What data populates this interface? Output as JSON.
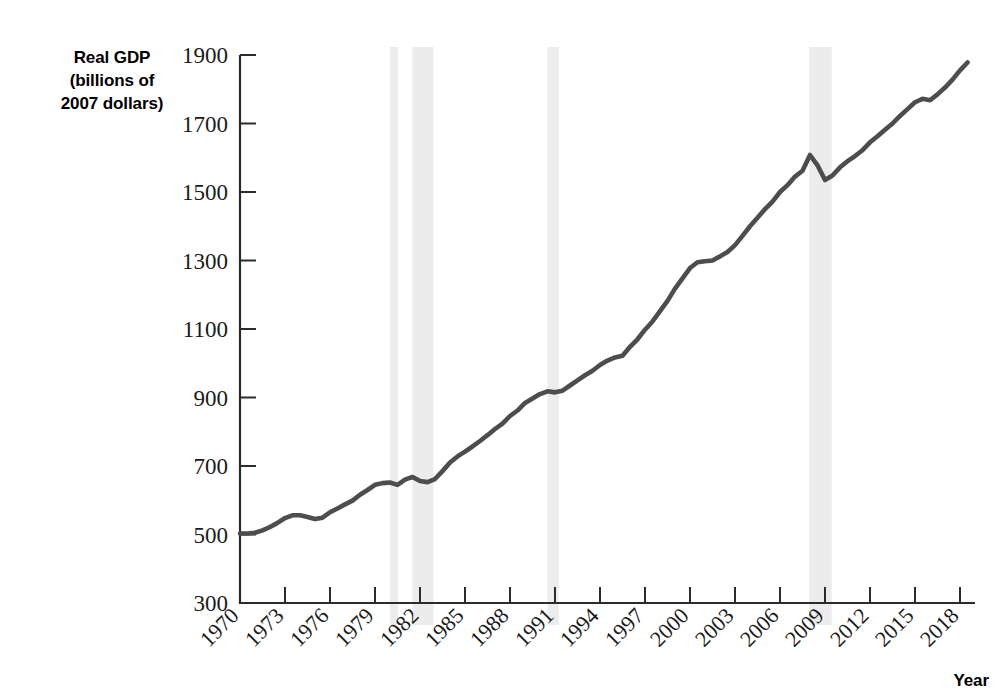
{
  "chart_data": {
    "type": "line",
    "title": "",
    "ylabel": "Real GDP (billions of 2007 dollars)",
    "ylabel_lines": [
      "Real GDP",
      "(billions of",
      "2007 dollars)"
    ],
    "xlabel": "Year",
    "xlim": [
      1970,
      2019
    ],
    "ylim": [
      300,
      1900
    ],
    "ytick_labels": [
      "1900",
      "1700",
      "1500",
      "1300",
      "1100",
      "900",
      "700",
      "500",
      "300"
    ],
    "ytick_values": [
      1900,
      1700,
      1500,
      1300,
      1100,
      900,
      700,
      500,
      300
    ],
    "xtick_labels": [
      "1970",
      "1973",
      "1976",
      "1979",
      "1982",
      "1985",
      "1988",
      "1991",
      "1994",
      "1997",
      "2000",
      "2003",
      "2006",
      "2009",
      "2012",
      "2015",
      "2018"
    ],
    "xtick_values": [
      1970,
      1973,
      1976,
      1979,
      1982,
      1985,
      1988,
      1991,
      1994,
      1997,
      2000,
      2003,
      2006,
      2009,
      2012,
      2015,
      2018
    ],
    "grid": false,
    "legend": null,
    "line_color": "#4d4d4d",
    "recession_band_color": "#ececec",
    "recession_bands": [
      {
        "start": 1980.0,
        "end": 1980.55,
        "label": "1980 recession"
      },
      {
        "start": 1981.5,
        "end": 1982.9,
        "label": "1981-82 recession"
      },
      {
        "start": 1990.5,
        "end": 1991.25,
        "label": "1990-91 recession"
      },
      {
        "start": 2007.95,
        "end": 2009.45,
        "label": "2007-09 recession"
      }
    ],
    "series": [
      {
        "name": "Real GDP",
        "x": [
          1970.0,
          1970.5,
          1971.0,
          1971.5,
          1972.0,
          1972.5,
          1973.0,
          1973.5,
          1974.0,
          1974.5,
          1975.0,
          1975.5,
          1976.0,
          1976.5,
          1977.0,
          1977.5,
          1978.0,
          1978.5,
          1979.0,
          1979.5,
          1980.0,
          1980.5,
          1981.0,
          1981.5,
          1982.0,
          1982.5,
          1983.0,
          1983.5,
          1984.0,
          1984.5,
          1985.0,
          1985.5,
          1986.0,
          1986.5,
          1987.0,
          1987.5,
          1988.0,
          1988.5,
          1989.0,
          1989.5,
          1990.0,
          1990.5,
          1991.0,
          1991.5,
          1992.0,
          1992.5,
          1993.0,
          1993.5,
          1994.0,
          1994.5,
          1995.0,
          1995.5,
          1996.0,
          1996.5,
          1997.0,
          1997.5,
          1998.0,
          1998.5,
          1999.0,
          1999.5,
          2000.0,
          2000.5,
          2001.0,
          2001.5,
          2002.0,
          2002.5,
          2003.0,
          2003.5,
          2004.0,
          2004.5,
          2005.0,
          2005.5,
          2006.0,
          2006.5,
          2007.0,
          2007.5,
          2008.0,
          2008.5,
          2009.0,
          2009.5,
          2010.0,
          2010.5,
          2011.0,
          2011.5,
          2012.0,
          2012.5,
          2013.0,
          2013.5,
          2014.0,
          2014.5,
          2015.0,
          2015.5,
          2016.0,
          2016.5,
          2017.0,
          2017.5,
          2018.0,
          2018.5
        ],
        "y": [
          503,
          503,
          505,
          512,
          522,
          534,
          548,
          556,
          556,
          551,
          545,
          549,
          565,
          576,
          588,
          599,
          616,
          630,
          645,
          650,
          652,
          645,
          660,
          668,
          656,
          653,
          662,
          685,
          710,
          728,
          742,
          757,
          773,
          790,
          808,
          824,
          846,
          862,
          884,
          897,
          910,
          918,
          915,
          920,
          935,
          950,
          965,
          978,
          995,
          1008,
          1017,
          1022,
          1048,
          1070,
          1098,
          1122,
          1152,
          1182,
          1218,
          1248,
          1278,
          1295,
          1298,
          1300,
          1312,
          1325,
          1345,
          1372,
          1400,
          1425,
          1450,
          1472,
          1500,
          1520,
          1545,
          1562,
          1608,
          1578,
          1535,
          1548,
          1572,
          1590,
          1605,
          1622,
          1645,
          1663,
          1682,
          1700,
          1722,
          1742,
          1762,
          1772,
          1768,
          1785,
          1805,
          1828,
          1855,
          1878
        ]
      }
    ]
  }
}
